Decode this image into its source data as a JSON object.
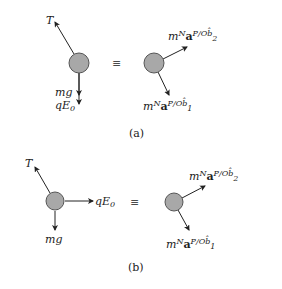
{
  "figure": {
    "panel_a": {
      "caption": "(a)",
      "equiv": "≡",
      "left": {
        "forces": [
          {
            "label": "T",
            "direction": "up-left"
          },
          {
            "label": "mg",
            "direction": "down"
          },
          {
            "label": "qE",
            "sub": "0",
            "direction": "down"
          }
        ]
      },
      "right": {
        "forces": [
          {
            "m": "m",
            "sup1": "N",
            "a": "a",
            "sup2": "P/O",
            "b": "b̂",
            "sub": "2",
            "direction": "up-right"
          },
          {
            "m": "m",
            "sup1": "N",
            "a": "a",
            "sup2": "P/O",
            "b": "b̂",
            "sub": "1",
            "direction": "down-right"
          }
        ]
      }
    },
    "panel_b": {
      "caption": "(b)",
      "equiv": "≡",
      "left": {
        "forces": [
          {
            "label": "T",
            "direction": "up-left"
          },
          {
            "label": "qE",
            "sub": "0",
            "direction": "right"
          },
          {
            "label": "mg",
            "direction": "down"
          }
        ]
      },
      "right": {
        "forces": [
          {
            "m": "m",
            "sup1": "N",
            "a": "a",
            "sup2": "P/O",
            "b": "b̂",
            "sub": "2",
            "direction": "up-right"
          },
          {
            "m": "m",
            "sup1": "N",
            "a": "a",
            "sup2": "P/O",
            "b": "b̂",
            "sub": "1",
            "direction": "down-right"
          }
        ]
      }
    }
  },
  "colors": {
    "ball_fill": "#a8a8a8",
    "ball_stroke": "#555555",
    "line": "#222222"
  }
}
